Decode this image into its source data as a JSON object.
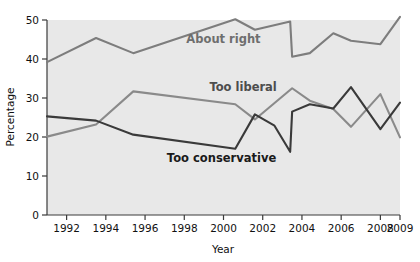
{
  "chart_data": {
    "type": "line",
    "title": "",
    "subtitle": "",
    "xlabel": "Year",
    "ylabel": "Percentage",
    "xlim": [
      1991,
      2009
    ],
    "ylim": [
      0,
      50
    ],
    "grid": false,
    "legend_position": "inline-labels",
    "background_color": "#e8e8e8",
    "x_ticks": [
      1992,
      1994,
      1996,
      1998,
      2000,
      2002,
      2004,
      2006,
      2008,
      2009
    ],
    "x_tick_labels": [
      "1992",
      "1994",
      "1996",
      "1998",
      "2000",
      "2002",
      "2004",
      "2006",
      "2008",
      "2009"
    ],
    "y_ticks": [
      0,
      10,
      20,
      30,
      40,
      50
    ],
    "y_tick_labels": [
      "0",
      "10",
      "20",
      "30",
      "40",
      "50"
    ],
    "series": [
      {
        "name": "About right",
        "color": "#7d7d7d",
        "label_x": 2000.0,
        "label_y": 44.0,
        "label_color": "#6e6e6e",
        "x": [
          1991.0,
          1993.5,
          1995.4,
          2000.6,
          2001.6,
          2003.4,
          2003.5,
          2004.4,
          2005.6,
          2006.5,
          2008.0,
          2009.0
        ],
        "y": [
          39.2,
          45.4,
          41.5,
          50.2,
          47.5,
          49.6,
          40.6,
          41.5,
          46.6,
          44.7,
          43.8,
          50.8
        ]
      },
      {
        "name": "Too liberal",
        "color": "#8a8a8a",
        "label_x": 2001.0,
        "label_y": 31.8,
        "label_color": "#4d4d4d",
        "x": [
          1991.0,
          1993.5,
          1995.4,
          2000.6,
          2001.6,
          2003.5,
          2004.4,
          2005.6,
          2006.5,
          2008.0,
          2009.0
        ],
        "y": [
          20.1,
          23.2,
          31.7,
          28.4,
          24.5,
          32.5,
          29.3,
          27.2,
          22.6,
          31.0,
          19.9
        ]
      },
      {
        "name": "Too conservative",
        "color": "#3a3a3a",
        "label_x": 1999.9,
        "label_y": 13.5,
        "label_color": "#1a1a1a",
        "x": [
          1991.0,
          1993.5,
          1995.4,
          2000.6,
          2001.6,
          2002.6,
          2003.4,
          2003.5,
          2004.4,
          2005.6,
          2006.5,
          2008.0,
          2009.0
        ],
        "y": [
          25.3,
          24.2,
          20.6,
          17.0,
          25.8,
          22.9,
          16.2,
          26.5,
          28.4,
          27.3,
          32.8,
          22.0,
          28.8
        ]
      }
    ]
  },
  "axes": {
    "y_axis_title": "Percentage",
    "x_axis_title": "Year"
  }
}
